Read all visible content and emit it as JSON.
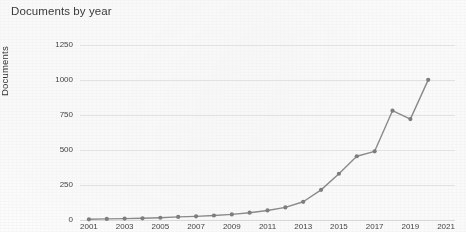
{
  "chart_data": {
    "type": "line",
    "title": "Documents by year",
    "xlabel": "",
    "ylabel": "Documents",
    "x": [
      2001,
      2002,
      2003,
      2004,
      2005,
      2006,
      2007,
      2008,
      2009,
      2010,
      2011,
      2012,
      2013,
      2014,
      2015,
      2016,
      2017,
      2018,
      2019,
      2020
    ],
    "values": [
      5,
      8,
      10,
      12,
      16,
      22,
      26,
      32,
      40,
      52,
      68,
      90,
      130,
      215,
      330,
      455,
      490,
      780,
      720,
      1000
    ],
    "series": [
      {
        "name": "Documents",
        "values": [
          5,
          8,
          10,
          12,
          16,
          22,
          26,
          32,
          40,
          52,
          68,
          90,
          130,
          215,
          330,
          455,
          490,
          780,
          720,
          1000
        ]
      }
    ],
    "xlim": [
      2000.5,
      2021.5
    ],
    "ylim": [
      0,
      1320
    ],
    "y_ticks": [
      0,
      250,
      500,
      750,
      1000,
      1250
    ],
    "y_tick_labels": [
      "0",
      "250",
      "500",
      "750",
      "1000",
      "1250"
    ],
    "x_ticks": [
      2001,
      2003,
      2005,
      2007,
      2009,
      2011,
      2013,
      2015,
      2017,
      2019,
      2021
    ],
    "x_tick_labels": [
      "2001",
      "2003",
      "2005",
      "2007",
      "2009",
      "2011",
      "2013",
      "2015",
      "2017",
      "2019",
      "2021"
    ],
    "grid": true,
    "legend": false,
    "legend_position": "none",
    "marker": "circle",
    "line_color": "#8a8a8a",
    "marker_color": "#7d7d7d",
    "grid_color": "#e2e2e2",
    "text_color": "#3a3a3a",
    "background_color": "#fdfdfd",
    "annotations": []
  }
}
